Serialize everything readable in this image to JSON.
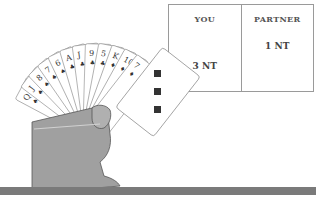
{
  "bidding": {
    "columns": [
      {
        "header": "YOU",
        "bid": "3 NT"
      },
      {
        "header": "PARTNER",
        "bid": "1 NT"
      }
    ]
  },
  "hand": {
    "cards": [
      {
        "rank": "Q",
        "suit": "♠"
      },
      {
        "rank": "J",
        "suit": "♠"
      },
      {
        "rank": "8",
        "suit": "♠"
      },
      {
        "rank": "7",
        "suit": "♠"
      },
      {
        "rank": "6",
        "suit": "♠"
      },
      {
        "rank": "A",
        "suit": "♣"
      },
      {
        "rank": "J",
        "suit": "♣"
      },
      {
        "rank": "9",
        "suit": "♣"
      },
      {
        "rank": "5",
        "suit": "♣"
      },
      {
        "rank": "K",
        "suit": "♦"
      },
      {
        "rank": "10",
        "suit": "♦"
      },
      {
        "rank": "7",
        "suit": "♦"
      },
      {
        "rank": "3",
        "suit": "♦"
      }
    ],
    "front_card": {
      "rank": "3",
      "suit": "♦"
    }
  },
  "colors": {
    "hand": "#9e9e9e",
    "table_edge": "#7a7a7a",
    "border": "#9a9a9a"
  }
}
